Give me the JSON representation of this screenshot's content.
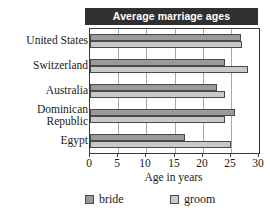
{
  "chart_data": {
    "type": "bar",
    "orientation": "horizontal",
    "title": "Average marriage ages",
    "xlabel": "Age in years",
    "ylabel": "",
    "xlim": [
      0,
      30
    ],
    "xticks": [
      0,
      5,
      10,
      15,
      20,
      25,
      30
    ],
    "xtick_labels": [
      "0",
      "5",
      "10",
      "15",
      "20",
      "25",
      "30"
    ],
    "grid": "vertical",
    "legend_position": "bottom",
    "categories": [
      "United States",
      "Switzerland",
      "Australia",
      "Dominican\nRepublic",
      "Egypt"
    ],
    "series": [
      {
        "name": "bride",
        "color": "#9a9a9a",
        "values": [
          26.8,
          24.0,
          22.5,
          25.8,
          16.8
        ]
      },
      {
        "name": "groom",
        "color": "#c9c9c9",
        "values": [
          26.9,
          28.0,
          24.0,
          24.0,
          25.0
        ]
      }
    ]
  },
  "legend": {
    "items": [
      {
        "label": "bride",
        "swatch": "bride"
      },
      {
        "label": "groom",
        "swatch": "groom"
      }
    ]
  },
  "colors": {
    "title_bar_background": "#303030",
    "title_bar_text": "#ffffff",
    "bride": "#9a9a9a",
    "groom": "#c9c9c9",
    "gridline": "#a8a8a8",
    "axis": "#3a3a3a",
    "plot_background": "#ffffff"
  }
}
